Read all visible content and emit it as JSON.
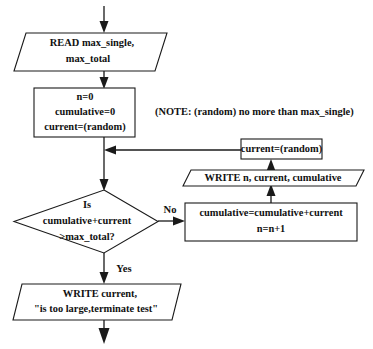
{
  "diagram": {
    "background_color": "#ffffff",
    "line_color": "#1a1a1a",
    "text_color": "#111111",
    "width": 373,
    "height": 349
  },
  "nodes": {
    "read_input": {
      "type": "io-parallelogram",
      "line1": "READ max_single,",
      "line2": "max_total"
    },
    "initialize": {
      "type": "process-box",
      "line1": "n=0",
      "line2": "cumulative=0",
      "line3": "current=(random)"
    },
    "note": {
      "type": "annotation",
      "text": "(NOTE: (random) no more than max_single)"
    },
    "decision": {
      "type": "decision-diamond",
      "line1": "Is",
      "line2": "cumulative+current",
      "line3": ">max_total?"
    },
    "accumulate": {
      "type": "process-box",
      "line1": "cumulative=cumulative+current",
      "line2": "n=n+1"
    },
    "write_trace": {
      "type": "io-parallelogram",
      "line1": "WRITE n, current, cumulative"
    },
    "new_random": {
      "type": "process-box",
      "line1": "current=(random)"
    },
    "write_terminate": {
      "type": "io-parallelogram",
      "line1": "WRITE current,",
      "line2": "\"is too large,terminate test\""
    }
  },
  "edge_labels": {
    "no_branch": "No",
    "yes_branch": "Yes"
  }
}
